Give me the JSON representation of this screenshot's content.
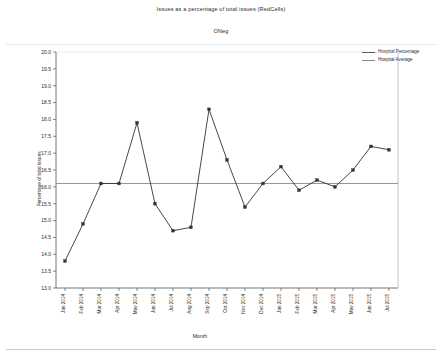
{
  "chart_data": {
    "type": "line",
    "title": "Issues as a percentage of total issues (RedCells)",
    "subtitle": "ONeg",
    "xlabel": "Month",
    "ylabel": "Percentage of total issues",
    "ylim": [
      13.0,
      20.0
    ],
    "ytick_step": 0.5,
    "grid": false,
    "legend_position": "top-right",
    "categories": [
      "Jan 2014",
      "Feb 2014",
      "Mar 2014",
      "Apr 2014",
      "May 2014",
      "Jun 2014",
      "Jul 2014",
      "Aug 2014",
      "Sep 2014",
      "Oct 2014",
      "Nov 2014",
      "Dec 2014",
      "Jan 2015",
      "Feb 2015",
      "Mar 2015",
      "Apr 2015",
      "May 2015",
      "Jun 2015",
      "Jul 2015"
    ],
    "yticks": [
      "13.0",
      "13.5",
      "14.0",
      "14.5",
      "15.0",
      "15.5",
      "16.0",
      "16.5",
      "17.0",
      "17.5",
      "18.0",
      "18.5",
      "19.0",
      "19.5",
      "20.0"
    ],
    "series": [
      {
        "name": "Hospital Percentage",
        "color": "#333333",
        "marker": "square",
        "values": [
          13.8,
          14.9,
          16.1,
          16.1,
          17.9,
          15.5,
          14.7,
          14.8,
          18.3,
          16.8,
          15.4,
          16.1,
          16.6,
          15.9,
          16.2,
          16.0,
          16.5,
          17.2,
          17.1
        ]
      },
      {
        "name": "Hospital Average",
        "color": "#8a8a8a",
        "marker": "none",
        "type": "hline",
        "value": 16.1
      }
    ]
  },
  "legend": {
    "items": [
      {
        "label": "Hospital Percentage"
      },
      {
        "label": "Hospital Average"
      }
    ]
  },
  "colors": {
    "series_line": "#333333",
    "average_line": "#8a8a8a",
    "axis": "#555555",
    "text": "#2b2b2b"
  }
}
